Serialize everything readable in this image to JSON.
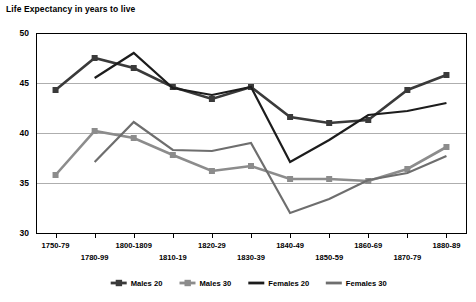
{
  "chart_data": {
    "type": "line",
    "title": "Life Expectancy in years to live",
    "xlabel": "",
    "ylabel": "",
    "ylim": [
      30,
      50
    ],
    "yticks": [
      30,
      35,
      40,
      45,
      50
    ],
    "grid": true,
    "legend_position": "bottom",
    "categories": [
      "1750-79",
      "1780-99",
      "1800-1809",
      "1810-19",
      "1820-29",
      "1830-39",
      "1840-49",
      "1850-59",
      "1860-69",
      "1870-79",
      "1880-89"
    ],
    "series": [
      {
        "name": "Males 20",
        "color": "#3a3a3a",
        "marker": "square",
        "values": [
          44.3,
          47.5,
          46.5,
          44.6,
          43.4,
          44.6,
          41.6,
          41.0,
          41.3,
          44.3,
          45.8
        ]
      },
      {
        "name": "Males 30",
        "color": "#8c8c8c",
        "marker": "square",
        "values": [
          35.8,
          40.2,
          39.5,
          37.8,
          36.2,
          36.7,
          35.4,
          35.4,
          35.2,
          36.4,
          38.6
        ]
      },
      {
        "name": "Females 20",
        "color": "#1c1c1c",
        "marker": "none",
        "values": [
          null,
          45.5,
          48.0,
          44.5,
          43.8,
          44.6,
          37.1,
          39.3,
          41.8,
          42.2,
          43.0
        ]
      },
      {
        "name": "Females 30",
        "color": "#6e6e6e",
        "marker": "none",
        "values": [
          null,
          37.1,
          41.1,
          38.3,
          38.2,
          39.0,
          32.0,
          33.4,
          35.3,
          36.0,
          37.7
        ]
      }
    ]
  },
  "legend": {
    "items": [
      {
        "label": "Males 20"
      },
      {
        "label": "Males 30"
      },
      {
        "label": "Females 20"
      },
      {
        "label": "Females 30"
      }
    ]
  }
}
